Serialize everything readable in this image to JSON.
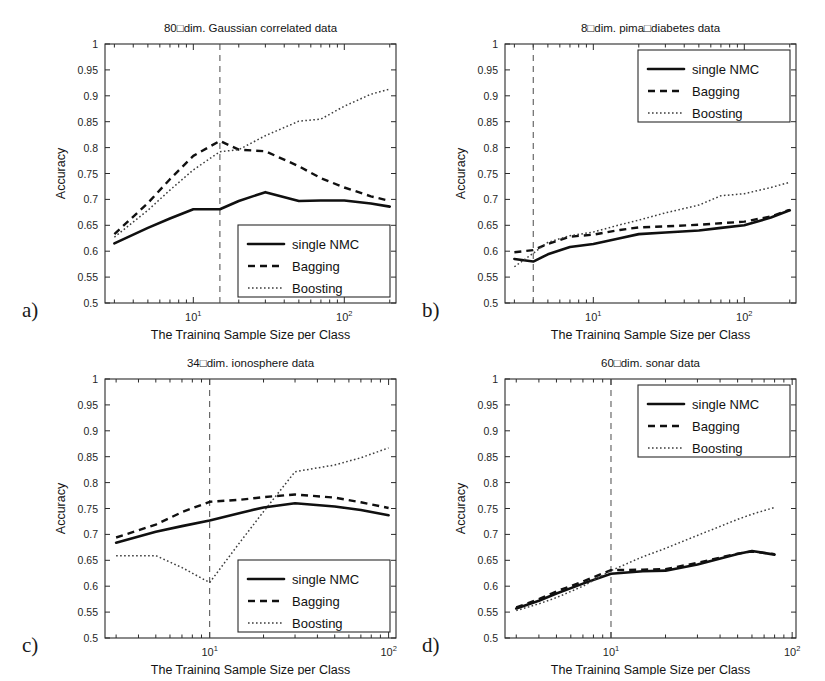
{
  "figure": {
    "axis_x_label": "The Training Sample Size per Class",
    "axis_y_label": "Accuracy",
    "panel_labels": {
      "a": "a)",
      "b": "b)",
      "c": "c)",
      "d": "d)"
    },
    "legend_entries": [
      "single NMC",
      "Bagging",
      "Boosting"
    ],
    "x_tick_labels": [
      "10",
      "10"
    ],
    "x_tick_exponents": [
      "1",
      "2"
    ],
    "y_tick_labels": [
      "0.5",
      "0.55",
      "0.6",
      "0.65",
      "0.7",
      "0.75",
      "0.8",
      "0.85",
      "0.9",
      "0.95",
      "1"
    ],
    "colors": {
      "axis": "#2b2b2b",
      "single_nmc": "#101010",
      "bagging": "#101010",
      "boosting": "#3d3d3d",
      "critical_line": "#4a4a4a",
      "background": "#ffffff"
    }
  },
  "chart_data": [
    {
      "type": "line",
      "panel": "a",
      "title": "80□dim. Gaussian correlated data",
      "xlabel": "The Training Sample Size per Class",
      "ylabel": "Accuracy",
      "xscale": "log",
      "xlim": [
        2.6,
        220
      ],
      "ylim": [
        0.5,
        1.0
      ],
      "yticks": [
        0.5,
        0.55,
        0.6,
        0.65,
        0.7,
        0.75,
        0.8,
        0.85,
        0.9,
        0.95,
        1.0
      ],
      "xticks": [
        10,
        100
      ],
      "grid": false,
      "legend_position": "lower-right",
      "critical_x": 15,
      "annotations": [
        "vertical dashed line at training sample size 15"
      ],
      "x": [
        3,
        5,
        7,
        10,
        15,
        20,
        30,
        50,
        70,
        100,
        150,
        200
      ],
      "series": [
        {
          "name": "single NMC",
          "style": "solid",
          "values": [
            0.615,
            0.645,
            0.663,
            0.681,
            0.681,
            0.697,
            0.714,
            0.697,
            0.698,
            0.698,
            0.692,
            0.686
          ]
        },
        {
          "name": "Bagging",
          "style": "dashed",
          "values": [
            0.633,
            0.693,
            0.739,
            0.784,
            0.813,
            0.796,
            0.793,
            0.764,
            0.741,
            0.723,
            0.706,
            0.697
          ]
        },
        {
          "name": "Boosting",
          "style": "dotted",
          "values": [
            0.627,
            0.679,
            0.718,
            0.757,
            0.792,
            0.796,
            0.823,
            0.851,
            0.855,
            0.88,
            0.903,
            0.913
          ]
        }
      ]
    },
    {
      "type": "line",
      "panel": "b",
      "title": "8□dim. pima□diabetes data",
      "xlabel": "The Training Sample Size per Class",
      "ylabel": "Accuracy",
      "xscale": "log",
      "xlim": [
        2.6,
        220
      ],
      "ylim": [
        0.5,
        1.0
      ],
      "yticks": [
        0.5,
        0.55,
        0.6,
        0.65,
        0.7,
        0.75,
        0.8,
        0.85,
        0.9,
        0.95,
        1.0
      ],
      "xticks": [
        10,
        100
      ],
      "grid": false,
      "legend_position": "upper-right",
      "critical_x": 4,
      "annotations": [
        "vertical dashed line at training sample size 4"
      ],
      "x": [
        3,
        4,
        5,
        7,
        10,
        15,
        20,
        30,
        50,
        70,
        100,
        150,
        200
      ],
      "series": [
        {
          "name": "single NMC",
          "style": "solid",
          "values": [
            0.585,
            0.58,
            0.594,
            0.608,
            0.614,
            0.625,
            0.633,
            0.636,
            0.64,
            0.645,
            0.65,
            0.665,
            0.679
          ]
        },
        {
          "name": "Bagging",
          "style": "dashed",
          "values": [
            0.598,
            0.602,
            0.614,
            0.628,
            0.632,
            0.641,
            0.646,
            0.648,
            0.651,
            0.654,
            0.657,
            0.667,
            0.68
          ]
        },
        {
          "name": "Boosting",
          "style": "dotted",
          "values": [
            0.57,
            0.596,
            0.617,
            0.63,
            0.637,
            0.651,
            0.66,
            0.674,
            0.689,
            0.707,
            0.711,
            0.723,
            0.733
          ]
        }
      ]
    },
    {
      "type": "line",
      "panel": "c",
      "title": "34□dim. ionosphere data",
      "xlabel": "The Training Sample Size per Class",
      "ylabel": "Accuracy",
      "xscale": "log",
      "xlim": [
        2.6,
        110
      ],
      "ylim": [
        0.5,
        1.0
      ],
      "yticks": [
        0.5,
        0.55,
        0.6,
        0.65,
        0.7,
        0.75,
        0.8,
        0.85,
        0.9,
        0.95,
        1.0
      ],
      "xticks": [
        10,
        100
      ],
      "grid": false,
      "legend_position": "lower-right",
      "critical_x": 10,
      "annotations": [
        "vertical dashed line at training sample size 10"
      ],
      "x": [
        3,
        5,
        7,
        10,
        15,
        20,
        30,
        50,
        70,
        100
      ],
      "series": [
        {
          "name": "single NMC",
          "style": "solid",
          "values": [
            0.684,
            0.705,
            0.716,
            0.727,
            0.742,
            0.752,
            0.76,
            0.754,
            0.747,
            0.737
          ]
        },
        {
          "name": "Bagging",
          "style": "dashed",
          "values": [
            0.694,
            0.719,
            0.743,
            0.763,
            0.767,
            0.772,
            0.777,
            0.771,
            0.762,
            0.751
          ]
        },
        {
          "name": "Boosting",
          "style": "dotted",
          "values": [
            0.659,
            0.659,
            0.636,
            0.607,
            0.688,
            0.744,
            0.821,
            0.834,
            0.848,
            0.867
          ]
        }
      ]
    },
    {
      "type": "line",
      "panel": "d",
      "title": "60□dim. sonar data",
      "xlabel": "The Training Sample Size per Class",
      "ylabel": "Accuracy",
      "xscale": "log",
      "xlim": [
        2.6,
        105
      ],
      "ylim": [
        0.5,
        1.0
      ],
      "yticks": [
        0.5,
        0.55,
        0.6,
        0.65,
        0.7,
        0.75,
        0.8,
        0.85,
        0.9,
        0.95,
        1.0
      ],
      "xticks": [
        10,
        100
      ],
      "grid": false,
      "legend_position": "upper-right",
      "critical_x": 10,
      "annotations": [
        "vertical dashed line at training sample size 10"
      ],
      "x": [
        3,
        4,
        5,
        7,
        10,
        15,
        20,
        30,
        50,
        60,
        80
      ],
      "series": [
        {
          "name": "single NMC",
          "style": "solid",
          "values": [
            0.557,
            0.572,
            0.586,
            0.605,
            0.624,
            0.629,
            0.63,
            0.642,
            0.662,
            0.668,
            0.661
          ]
        },
        {
          "name": "Bagging",
          "style": "dashed",
          "values": [
            0.559,
            0.575,
            0.59,
            0.609,
            0.631,
            0.632,
            0.633,
            0.645,
            0.663,
            0.667,
            0.662
          ]
        },
        {
          "name": "Boosting",
          "style": "dotted",
          "values": [
            0.553,
            0.566,
            0.578,
            0.6,
            0.63,
            0.657,
            0.673,
            0.698,
            0.729,
            0.739,
            0.752
          ]
        }
      ]
    }
  ]
}
